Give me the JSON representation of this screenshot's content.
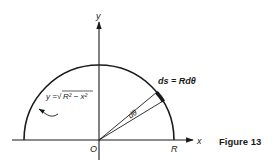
{
  "figure": {
    "caption": "Figure 13",
    "labels": {
      "y_axis": "y",
      "x_axis": "x",
      "origin": "O",
      "radius_point": "R",
      "arc_length": "ds = Rdθ",
      "angle": "dθ",
      "curve_eq_prefix": "y = ",
      "curve_eq_sqrt": "√",
      "curve_eq_body": "R² − x²"
    },
    "colors": {
      "ink": "#1a1a1a",
      "background": "#ffffff"
    }
  }
}
